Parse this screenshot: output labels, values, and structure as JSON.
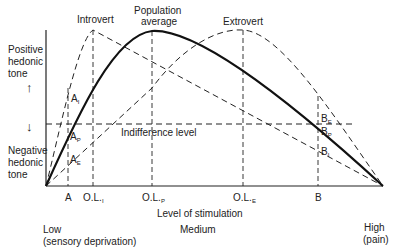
{
  "curves": {
    "introvert": "Introvert",
    "population": "Population",
    "population2": "average",
    "extrovert": "Extrovert"
  },
  "yaxis": {
    "positive1": "Positive",
    "positive2": "hedonic",
    "positive3": "tone",
    "negative1": "Negative",
    "negative2": "hedonic",
    "negative3": "tone",
    "up_arrow": "↑",
    "down_arrow": "↓"
  },
  "indifference": "Indifference level",
  "points": {
    "AI": "A",
    "AI_sub": "I",
    "AP": "A",
    "AP_sub": "P",
    "AE": "A",
    "AE_sub": "E",
    "BE": "B",
    "BE_sub": "E",
    "BP": "B",
    "BP_sub": "P",
    "BI": "B",
    "BI_sub": "I"
  },
  "xticks": {
    "A": "A",
    "OLI": "O.L.",
    "OLI_sub": "I",
    "OLP": "O.L.",
    "OLP_sub": "P",
    "OLE": "O.L.",
    "OLE_sub": "E",
    "B": "B"
  },
  "xaxis": {
    "title": "Level of stimulation",
    "low1": "Low",
    "low2": "(sensory deprivation)",
    "medium": "Medium",
    "high1": "High",
    "high2": "(pain)"
  }
}
